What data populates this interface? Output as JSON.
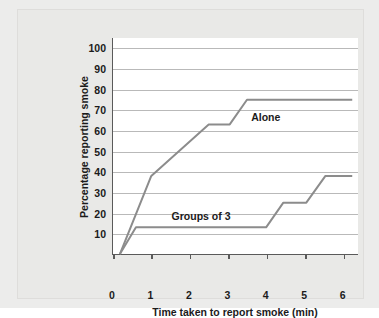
{
  "chart_data": {
    "type": "line",
    "title": "",
    "xlabel": "Time taken to report smoke (min)",
    "ylabel": "Percentage reporting smoke",
    "xlim": [
      0,
      6.4
    ],
    "ylim": [
      0,
      105
    ],
    "grid": true,
    "legend_position": "inline-annotation",
    "xticks": [
      "0",
      "1",
      "2",
      "3",
      "4",
      "5",
      "6"
    ],
    "xtick_values": [
      0,
      1,
      2,
      3,
      4,
      5,
      6
    ],
    "yticks": [
      "10",
      "20",
      "30",
      "40",
      "50",
      "60",
      "70",
      "80",
      "90",
      "100"
    ],
    "ytick_values": [
      10,
      20,
      30,
      40,
      50,
      60,
      70,
      80,
      90,
      100
    ],
    "series": [
      {
        "name": "Alone",
        "label": "Alone",
        "color": "#8c8c8c",
        "points": [
          [
            0.18,
            0
          ],
          [
            1.0,
            38
          ],
          [
            2.5,
            63
          ],
          [
            3.05,
            63
          ],
          [
            3.5,
            75
          ],
          [
            6.25,
            75
          ]
        ]
      },
      {
        "name": "Groups of 3",
        "label": "Groups of 3",
        "color": "#8c8c8c",
        "points": [
          [
            0.18,
            0
          ],
          [
            0.6,
            13
          ],
          [
            4.0,
            13
          ],
          [
            4.45,
            25
          ],
          [
            5.05,
            25
          ],
          [
            5.55,
            38
          ],
          [
            6.25,
            38
          ]
        ]
      }
    ],
    "annotations": [
      {
        "text": "Alone",
        "x": 3.62,
        "y": 67
      },
      {
        "text": "Groups of 3",
        "x": 1.55,
        "y": 19
      }
    ]
  },
  "figure": {
    "background_color": "#ececeb",
    "plot_background_color": "#ffffff",
    "axis_color": "#5a5a5a",
    "grid_color": "#b9b9b9",
    "line_color": "#8c8c8c"
  }
}
